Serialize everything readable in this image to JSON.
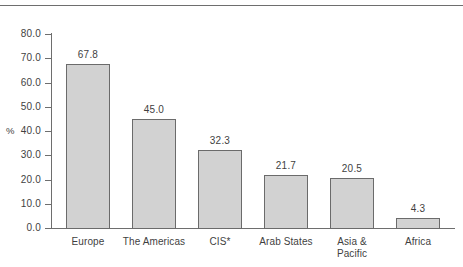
{
  "top_caption": {
    "left_text": "",
    "right_text": ""
  },
  "chart_data": {
    "type": "bar",
    "title": "",
    "subtitle": "",
    "xlabel": "",
    "ylabel": "%",
    "ylim": [
      0,
      80
    ],
    "ytick_step": 10,
    "grid": false,
    "legend": "none",
    "categories": [
      "Europe",
      "The Americas",
      "CIS*",
      "Arab States",
      "Asia & Pacific",
      "Africa"
    ],
    "category_lines": [
      [
        "Europe"
      ],
      [
        "The Americas"
      ],
      [
        "CIS*"
      ],
      [
        "Arab States"
      ],
      [
        "Asia &",
        "Pacific"
      ],
      [
        "Africa"
      ]
    ],
    "values": [
      67.8,
      45.0,
      32.3,
      21.7,
      20.5,
      4.3
    ],
    "value_labels": [
      "67.8",
      "45.0",
      "32.3",
      "21.7",
      "20.5",
      "4.3"
    ],
    "ytick_labels": [
      "80.0",
      "70.0",
      "60.0",
      "50.0",
      "40.0",
      "30.0",
      "20.0",
      "10.0",
      "0.0"
    ],
    "ytick_values": [
      80,
      70,
      60,
      50,
      40,
      30,
      20,
      10,
      0
    ],
    "bar_fill": "#d2d2d2",
    "bar_border": "#6b6b6b",
    "axis_color": "#6e6e6e",
    "text_color": "#3f3f3f"
  }
}
